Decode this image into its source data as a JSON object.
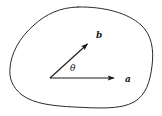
{
  "figure": {
    "background_color": "#ffffff",
    "stroke_color": "#2b2b2b",
    "label_color": "#1a1a1a",
    "region": {
      "name": "closed-curve-region",
      "description": "irregular closed blob outline",
      "stroke_width": "1",
      "fill": "none"
    },
    "vectors": [
      {
        "label": "a",
        "name": "vector-a",
        "origin": [
          50,
          78
        ],
        "tip": [
          120,
          78
        ],
        "direction_deg": 0
      },
      {
        "label": "b",
        "name": "vector-b",
        "origin": [
          50,
          78
        ],
        "tip": [
          92,
          40
        ],
        "direction_deg": 42
      }
    ],
    "angle": {
      "label": "θ",
      "name": "angle-theta",
      "between": [
        "a",
        "b"
      ],
      "label_position": [
        70,
        71
      ]
    },
    "labels": {
      "a_position": [
        125,
        82
      ],
      "b_position": [
        96,
        38
      ]
    }
  }
}
